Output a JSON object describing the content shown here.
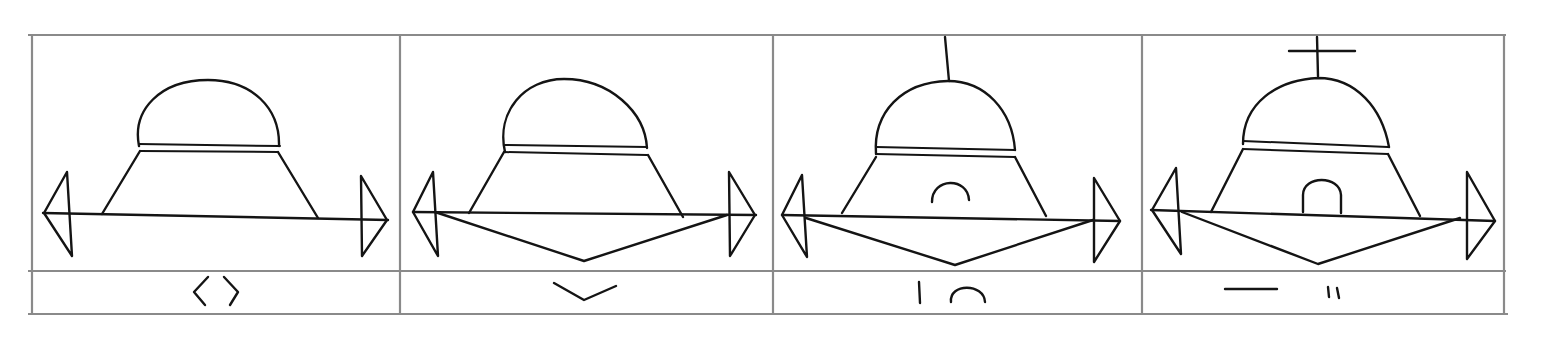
{
  "diagram": {
    "type": "hand-drawn comparison table",
    "layout": {
      "columns": 4,
      "rows": 2
    },
    "colors": {
      "ink": "#141414",
      "grid": "#8a8a8a",
      "background": "#ffffff"
    },
    "panels": [
      {
        "index": 1,
        "figure": "dome on trapezoid base with double band, horizontal axis with triangular arrowheads at both ends",
        "features": [
          "dome",
          "double-band",
          "trapezoid-base",
          "horizontal-axis",
          "left-arrowhead",
          "right-arrowhead"
        ],
        "caption_symbol": "〈 〉",
        "caption_name": "angle-brackets"
      },
      {
        "index": 2,
        "figure": "same figure with a downward V keel below the axis",
        "features": [
          "dome",
          "double-band",
          "trapezoid-base",
          "horizontal-axis",
          "left-arrowhead",
          "right-arrowhead",
          "v-keel"
        ],
        "caption_symbol": "⌄",
        "caption_name": "v-mark"
      },
      {
        "index": 3,
        "figure": "same figure with a vertical mast on the dome and an arch inside the base",
        "features": [
          "mast",
          "dome",
          "double-band",
          "trapezoid-base",
          "small-arch",
          "horizontal-axis",
          "left-arrowhead",
          "right-arrowhead",
          "v-keel"
        ],
        "caption_symbol": "| ∩",
        "caption_name": "bar-and-arch"
      },
      {
        "index": 4,
        "figure": "same figure with a cross on the dome and a closed doorway inside the base",
        "features": [
          "cross",
          "dome",
          "double-band",
          "trapezoid-base",
          "doorway",
          "horizontal-axis",
          "left-arrowhead",
          "right-arrowhead",
          "v-keel"
        ],
        "caption_symbol": "— ıı",
        "caption_name": "dash-and-double-stroke"
      }
    ]
  }
}
